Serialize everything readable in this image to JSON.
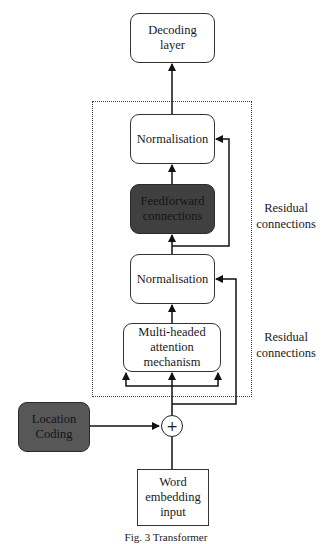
{
  "diagram": {
    "nodes": {
      "decoding": {
        "label": "Decoding layer",
        "line1": "Decoding",
        "line2": "layer"
      },
      "norm_top": {
        "label": "Normalisation"
      },
      "feedforward": {
        "label": "Feedforward connections",
        "line1": "Feedforward",
        "line2": "connections"
      },
      "norm_bottom": {
        "label": "Normalisation"
      },
      "attention": {
        "label": "Multi-headed attention mechanism",
        "line1": "Multi-headed",
        "line2": "attention",
        "line3": "mechanism"
      },
      "location": {
        "label": "Location Coding",
        "line1": "Location",
        "line2": "Coding"
      },
      "add": {
        "symbol": "+"
      },
      "embedding": {
        "label": "Word embedding input",
        "line1": "Word",
        "line2": "embedding",
        "line3": "input"
      }
    },
    "annotations": {
      "residual_top": {
        "line1": "Residual",
        "line2": "connections"
      },
      "residual_bottom": {
        "line1": "Residual",
        "line2": "connections"
      }
    },
    "edges": [
      {
        "from": "embedding",
        "to": "add"
      },
      {
        "from": "location",
        "to": "add"
      },
      {
        "from": "add",
        "to": "attention",
        "type": "three-way split"
      },
      {
        "from": "add",
        "to": "norm_bottom",
        "type": "residual"
      },
      {
        "from": "attention",
        "to": "norm_bottom"
      },
      {
        "from": "norm_bottom",
        "to": "feedforward"
      },
      {
        "from": "norm_bottom",
        "to": "norm_top",
        "type": "residual"
      },
      {
        "from": "feedforward",
        "to": "norm_top"
      },
      {
        "from": "norm_top",
        "to": "decoding"
      }
    ],
    "caption": "Fig. 3 Transformer"
  },
  "colors": {
    "dark_box": "#404040",
    "location_box": "#575757",
    "stroke": "#1a1a1a"
  }
}
